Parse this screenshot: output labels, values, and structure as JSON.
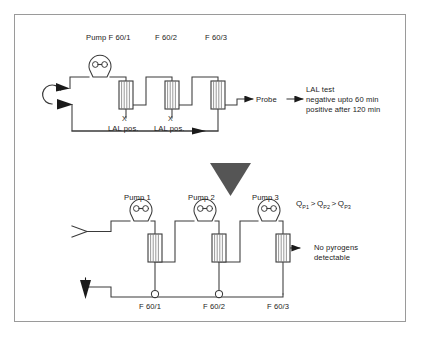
{
  "figure": {
    "border_color": "#9a9a9a",
    "line_color": "#3a3a3a",
    "chevron_color": "#555555"
  },
  "top_circuit": {
    "name": "LAL test circuit",
    "labels": {
      "pump": "Pump F 60/1",
      "filter2": "F 60/2",
      "filter3": "F 60/3",
      "lal_pos_1": "LAL pos.",
      "lal_pos_2": "LAL pos.",
      "x_mark_1": "X",
      "x_mark_2": "X",
      "probe": "Probe"
    },
    "result": {
      "heading": "LAL test",
      "line1": "negative upto 60 min",
      "line2": "positive after 120 min"
    }
  },
  "bottom_circuit": {
    "name": "Three pump cascade circuit",
    "labels": {
      "pump1": "Pump 1",
      "pump2": "Pump 2",
      "pump3": "Pump 3",
      "port1": "F 60/1",
      "port2": "F 60/2",
      "port3": "F 60/3"
    },
    "flow_relation": {
      "q1": "Q",
      "q1_sub": "P1",
      "op1": ">",
      "q2": "Q",
      "q2_sub": "P2",
      "op2": ">",
      "q3": "Q",
      "q3_sub": "P3"
    },
    "result": {
      "line1": "No pyrogens",
      "line2": "detectable"
    }
  }
}
